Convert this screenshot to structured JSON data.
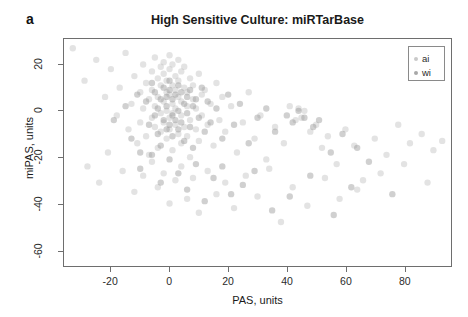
{
  "panel": {
    "label": "a"
  },
  "title": "High Sensitive Culture: miRTarBase",
  "axes": {
    "xlabel": "PAS, units",
    "ylabel": "miPAS, units"
  },
  "legend": {
    "entries": [
      {
        "label": "ai",
        "color": "#c9c9c9"
      },
      {
        "label": "wi",
        "color": "#a8a8a8"
      }
    ]
  },
  "chart_data": {
    "type": "scatter",
    "title": "High Sensitive Culture: miRTarBase",
    "xlabel": "PAS, units",
    "ylabel": "miPAS, units",
    "xlim": [
      -36,
      96
    ],
    "ylim": [
      -67,
      31
    ],
    "xticks": [
      -20,
      0,
      20,
      40,
      60,
      80
    ],
    "yticks": [
      20,
      0,
      -20,
      -40,
      -60
    ],
    "grid": false,
    "legend_position": "top-right",
    "marker": {
      "shape": "circle",
      "radius_px": 3.2,
      "fill_opacity": 0.42,
      "color_ai": "#bdbdbd",
      "color_wi": "#8f8f8f"
    },
    "series": [
      {
        "name": "ai",
        "color": "#bdbdbd",
        "points": [
          [
            -33,
            27
          ],
          [
            -29,
            13
          ],
          [
            -25,
            22
          ],
          [
            -22,
            6
          ],
          [
            -20,
            18
          ],
          [
            -18,
            -2
          ],
          [
            -17,
            10
          ],
          [
            -15,
            25
          ],
          [
            -14,
            -8
          ],
          [
            -13,
            3
          ],
          [
            -12,
            15
          ],
          [
            -11,
            -14
          ],
          [
            -10,
            8
          ],
          [
            -10,
            -5
          ],
          [
            -9,
            20
          ],
          [
            -9,
            1
          ],
          [
            -8,
            -11
          ],
          [
            -8,
            12
          ],
          [
            -7,
            5
          ],
          [
            -7,
            -19
          ],
          [
            -6,
            17
          ],
          [
            -6,
            -3
          ],
          [
            -6,
            9
          ],
          [
            -5,
            23
          ],
          [
            -5,
            -7
          ],
          [
            -5,
            2
          ],
          [
            -4,
            14
          ],
          [
            -4,
            -16
          ],
          [
            -4,
            6
          ],
          [
            -3,
            19
          ],
          [
            -3,
            -1
          ],
          [
            -3,
            11
          ],
          [
            -3,
            -9
          ],
          [
            -2,
            21
          ],
          [
            -2,
            4
          ],
          [
            -2,
            -5
          ],
          [
            -2,
            16
          ],
          [
            -1,
            8
          ],
          [
            -1,
            -12
          ],
          [
            -1,
            0
          ],
          [
            -1,
            13
          ],
          [
            0,
            24
          ],
          [
            0,
            -3
          ],
          [
            0,
            7
          ],
          [
            0,
            18
          ],
          [
            0,
            -8
          ],
          [
            1,
            3
          ],
          [
            1,
            11
          ],
          [
            1,
            -17
          ],
          [
            1,
            20
          ],
          [
            1,
            -1
          ],
          [
            2,
            9
          ],
          [
            2,
            -6
          ],
          [
            2,
            15
          ],
          [
            2,
            1
          ],
          [
            3,
            22
          ],
          [
            3,
            -10
          ],
          [
            3,
            6
          ],
          [
            3,
            13
          ],
          [
            4,
            -2
          ],
          [
            4,
            17
          ],
          [
            4,
            -14
          ],
          [
            4,
            4
          ],
          [
            5,
            10
          ],
          [
            5,
            -7
          ],
          [
            5,
            19
          ],
          [
            6,
            2
          ],
          [
            6,
            -11
          ],
          [
            6,
            8
          ],
          [
            7,
            14
          ],
          [
            7,
            -4
          ],
          [
            7,
            -20
          ],
          [
            8,
            5
          ],
          [
            8,
            11
          ],
          [
            9,
            -8
          ],
          [
            9,
            1
          ],
          [
            10,
            16
          ],
          [
            10,
            -13
          ],
          [
            11,
            7
          ],
          [
            11,
            -2
          ],
          [
            12,
            9
          ],
          [
            13,
            -6
          ],
          [
            14,
            3
          ],
          [
            15,
            -15
          ],
          [
            16,
            12
          ],
          [
            17,
            -4
          ],
          [
            18,
            6
          ],
          [
            19,
            -9
          ],
          [
            21,
            2
          ],
          [
            23,
            -18
          ],
          [
            25,
            -5
          ],
          [
            27,
            8
          ],
          [
            29,
            -12
          ],
          [
            31,
            -2
          ],
          [
            33,
            -21
          ],
          [
            36,
            -7
          ],
          [
            39,
            -14
          ],
          [
            41,
            2
          ],
          [
            43,
            -4
          ],
          [
            44,
            1
          ],
          [
            45,
            -3
          ],
          [
            46,
            0
          ],
          [
            48,
            -9
          ],
          [
            50,
            -6
          ],
          [
            52,
            -16
          ],
          [
            54,
            -11
          ],
          [
            57,
            -23
          ],
          [
            60,
            -8
          ],
          [
            63,
            -15
          ],
          [
            66,
            -30
          ],
          [
            70,
            -12
          ],
          [
            74,
            -19
          ],
          [
            78,
            -6
          ],
          [
            82,
            -14
          ],
          [
            86,
            -10
          ],
          [
            90,
            -17
          ],
          [
            93,
            -13
          ],
          [
            -28,
            -24
          ],
          [
            -24,
            -31
          ],
          [
            -21,
            -18
          ],
          [
            -16,
            -26
          ],
          [
            -12,
            -35
          ],
          [
            -9,
            -28
          ],
          [
            -6,
            -22
          ],
          [
            -4,
            -33
          ],
          [
            -2,
            -27
          ],
          [
            0,
            -40
          ],
          [
            2,
            -30
          ],
          [
            4,
            -24
          ],
          [
            6,
            -38
          ],
          [
            8,
            -29
          ],
          [
            10,
            -44
          ],
          [
            13,
            -26
          ],
          [
            16,
            -36
          ],
          [
            19,
            -31
          ],
          [
            22,
            -42
          ],
          [
            26,
            -28
          ],
          [
            30,
            -37
          ],
          [
            34,
            -25
          ],
          [
            38,
            -48
          ],
          [
            42,
            -33
          ],
          [
            47,
            -41
          ],
          [
            53,
            -29
          ],
          [
            58,
            -38
          ],
          [
            64,
            -34
          ],
          [
            72,
            -27
          ],
          [
            80,
            -23
          ],
          [
            88,
            -31
          ]
        ]
      },
      {
        "name": "wi",
        "color": "#8f8f8f",
        "points": [
          [
            -19,
            -4
          ],
          [
            -15,
            2
          ],
          [
            -13,
            -12
          ],
          [
            -11,
            7
          ],
          [
            -10,
            -18
          ],
          [
            -8,
            4
          ],
          [
            -7,
            -6
          ],
          [
            -6,
            12
          ],
          [
            -5,
            -2
          ],
          [
            -5,
            8
          ],
          [
            -4,
            -10
          ],
          [
            -4,
            1
          ],
          [
            -3,
            5
          ],
          [
            -3,
            -15
          ],
          [
            -2,
            10
          ],
          [
            -2,
            -4
          ],
          [
            -1,
            6
          ],
          [
            -1,
            -8
          ],
          [
            -1,
            2
          ],
          [
            0,
            13
          ],
          [
            0,
            -6
          ],
          [
            0,
            9
          ],
          [
            1,
            -2
          ],
          [
            1,
            5
          ],
          [
            1,
            -11
          ],
          [
            2,
            7
          ],
          [
            2,
            -4
          ],
          [
            3,
            11
          ],
          [
            3,
            0
          ],
          [
            3,
            -8
          ],
          [
            4,
            8
          ],
          [
            4,
            -5
          ],
          [
            5,
            3
          ],
          [
            5,
            -13
          ],
          [
            6,
            6
          ],
          [
            6,
            -1
          ],
          [
            7,
            9
          ],
          [
            7,
            -7
          ],
          [
            8,
            2
          ],
          [
            8,
            -16
          ],
          [
            9,
            5
          ],
          [
            10,
            -3
          ],
          [
            11,
            10
          ],
          [
            12,
            -9
          ],
          [
            13,
            4
          ],
          [
            14,
            -5
          ],
          [
            16,
            1
          ],
          [
            18,
            -12
          ],
          [
            20,
            7
          ],
          [
            22,
            -6
          ],
          [
            24,
            3
          ],
          [
            27,
            -14
          ],
          [
            30,
            -3
          ],
          [
            33,
            1
          ],
          [
            36,
            -9
          ],
          [
            40,
            -2
          ],
          [
            42,
            -5
          ],
          [
            44,
            0
          ],
          [
            46,
            -3
          ],
          [
            49,
            -7
          ],
          [
            51,
            -4
          ],
          [
            55,
            -18
          ],
          [
            59,
            -10
          ],
          [
            64,
            -16
          ],
          [
            68,
            -22
          ],
          [
            -10,
            -25
          ],
          [
            -6,
            -19
          ],
          [
            -3,
            -31
          ],
          [
            0,
            -21
          ],
          [
            3,
            -27
          ],
          [
            6,
            -34
          ],
          [
            9,
            -23
          ],
          [
            12,
            -39
          ],
          [
            15,
            -29
          ],
          [
            18,
            -24
          ],
          [
            21,
            -36
          ],
          [
            25,
            -32
          ],
          [
            29,
            -26
          ],
          [
            35,
            -43
          ],
          [
            41,
            -37
          ],
          [
            48,
            -28
          ],
          [
            56,
            -45
          ],
          [
            62,
            -33
          ],
          [
            76,
            -36
          ]
        ]
      }
    ]
  }
}
